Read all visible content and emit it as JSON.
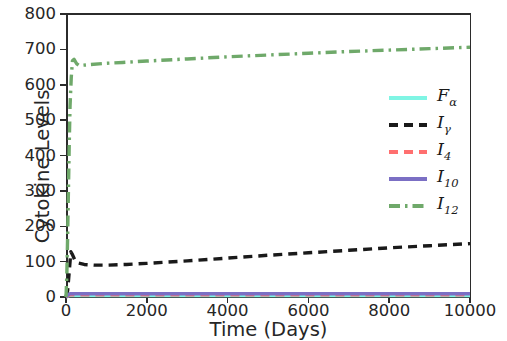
{
  "chart_data": {
    "type": "line",
    "title": "",
    "xlabel": "Time (Days)",
    "ylabel": "Cytokine Levels",
    "xlim": [
      0,
      10000
    ],
    "ylim": [
      0,
      800
    ],
    "grid": false,
    "legend_position": "center-right",
    "xticks": [
      0,
      2000,
      4000,
      6000,
      8000,
      10000
    ],
    "xtick_labels": [
      "0",
      "2000",
      "4000",
      "6000",
      "8000",
      "10000"
    ],
    "yticks": [
      0,
      100,
      200,
      300,
      400,
      500,
      600,
      700,
      800
    ],
    "ytick_labels": [
      "0",
      "100",
      "200",
      "300",
      "400",
      "500",
      "600",
      "700",
      "800"
    ],
    "series": [
      {
        "name": "F_a",
        "label_base": "F",
        "label_sub": "α",
        "color": "#7FF5E4",
        "style": "solid",
        "x": [
          0,
          50,
          100,
          200,
          400,
          800,
          1500,
          3000,
          5000,
          7000,
          8500,
          10000
        ],
        "values": [
          0,
          3,
          4,
          4,
          4,
          4,
          4,
          4,
          4,
          4,
          4,
          4
        ]
      },
      {
        "name": "I_y",
        "label_base": "I",
        "label_sub": "γ",
        "color": "#1a1a1a",
        "style": "dashed",
        "x": [
          0,
          40,
          80,
          120,
          160,
          220,
          300,
          450,
          700,
          1000,
          1500,
          2000,
          3000,
          4000,
          5000,
          6000,
          7000,
          8000,
          9000,
          10000
        ],
        "values": [
          0,
          18,
          72,
          128,
          120,
          104,
          96,
          92,
          90,
          90,
          92,
          95,
          102,
          110,
          118,
          125,
          132,
          139,
          145,
          151
        ]
      },
      {
        "name": "I_4",
        "label_base": "I",
        "label_sub": "4",
        "color": "#FF6F6F",
        "style": "dashed",
        "x": [
          0,
          50,
          100,
          200,
          400,
          800,
          1500,
          3000,
          5000,
          7000,
          8500,
          10000
        ],
        "values": [
          0,
          4,
          6,
          6,
          6,
          6,
          6,
          6,
          6,
          6,
          6,
          6
        ]
      },
      {
        "name": "I_10",
        "label_base": "I",
        "label_sub": "10",
        "color": "#7B6FC4",
        "style": "solid",
        "x": [
          0,
          50,
          100,
          200,
          400,
          800,
          1500,
          3000,
          5000,
          7000,
          8500,
          10000
        ],
        "values": [
          0,
          6,
          9,
          9,
          9,
          9,
          9,
          9,
          9,
          9,
          9,
          9
        ]
      },
      {
        "name": "I_12",
        "label_base": "I",
        "label_sub": "12",
        "color": "#6FA96A",
        "style": "dashdot",
        "x": [
          0,
          20,
          40,
          60,
          80,
          100,
          130,
          160,
          200,
          260,
          320,
          400,
          600,
          900,
          1400,
          2000,
          3000,
          4000,
          5000,
          6000,
          7000,
          8000,
          9000,
          10000
        ],
        "values": [
          0,
          60,
          170,
          300,
          430,
          540,
          620,
          668,
          672,
          660,
          655,
          655,
          657,
          660,
          663,
          667,
          673,
          679,
          684,
          689,
          694,
          698,
          702,
          706
        ]
      }
    ]
  }
}
